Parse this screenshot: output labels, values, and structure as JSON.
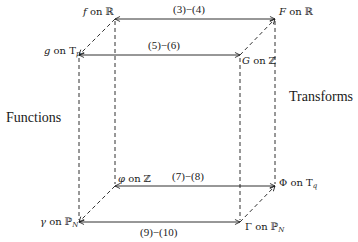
{
  "diagram": {
    "title_left": "Functions",
    "title_right": "Transforms",
    "nodes": {
      "f": {
        "symbol": "f",
        "on": "on",
        "domain": "ℝ",
        "sub": ""
      },
      "F": {
        "symbol": "F",
        "on": "on",
        "domain": "ℝ",
        "sub": ""
      },
      "g": {
        "symbol": "g",
        "on": "on",
        "domain": "T",
        "sub": "p"
      },
      "G": {
        "symbol": "G",
        "on": "on",
        "domain": "ℤ",
        "sub": ""
      },
      "phi": {
        "symbol": "φ",
        "on": "on",
        "domain": "ℤ",
        "sub": ""
      },
      "Phi": {
        "symbol": "Φ",
        "on": "on",
        "domain": "T",
        "sub": "q"
      },
      "gamma": {
        "symbol": "γ",
        "on": "on",
        "domain": "ℙ",
        "sub": "N"
      },
      "Gamma": {
        "symbol": "Γ",
        "on": "on",
        "domain": "ℙ",
        "sub": "N"
      }
    },
    "edges": {
      "f_F": "(3)−(4)",
      "g_G": "(5)−(6)",
      "phi_Phi": "(7)−(8)",
      "gamma_Gamma": "(9)−(10)"
    },
    "colors": {
      "line": "#1a1a1a",
      "background": "#ffffff"
    }
  }
}
